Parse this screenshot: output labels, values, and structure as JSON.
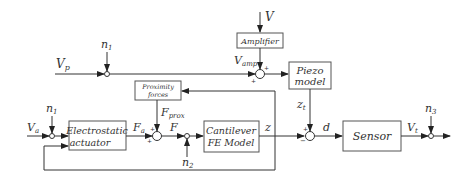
{
  "diagram": {
    "blocks": {
      "amplifier": "Amplifier",
      "piezo_1": "Piezo",
      "piezo_2": "model",
      "proximity_1": "Proximity",
      "proximity_2": "forces",
      "actuator_1": "Electrostatic",
      "actuator_2": "actuator",
      "cantilever_1": "Cantilever",
      "cantilever_2": "FE Model",
      "sensor": "Sensor"
    },
    "signals": {
      "V": "V",
      "Vp": "V",
      "Vp_sub": "p",
      "Vamp": "V",
      "Vamp_sub": "amp",
      "n1_top": "n",
      "n1_top_sub": "1",
      "n1_left": "n",
      "n1_left_sub": "1",
      "n2": "n",
      "n2_sub": "2",
      "n3": "n",
      "n3_sub": "3",
      "Va": "V",
      "Va_sub": "a",
      "Fa": "F",
      "Fa_sub": "a",
      "Fprox": "F",
      "Fprox_sub": "prox",
      "F": "F",
      "z": "z",
      "zt": "z",
      "zt_sub": "t",
      "d": "d",
      "Vt": "V",
      "Vt_sub": "t"
    },
    "signs": {
      "plus": "+",
      "minus": "−"
    }
  }
}
